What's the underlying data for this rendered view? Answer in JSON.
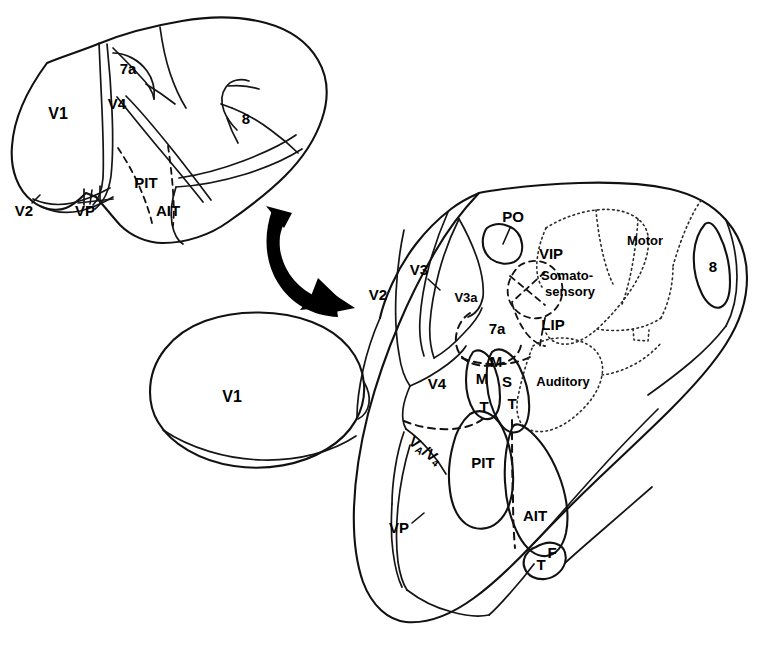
{
  "figure": {
    "background_color": "#ffffff",
    "ink_color": "#000000"
  },
  "lateral_view": {
    "name": "lateral-brain-view",
    "labels": [
      {
        "id": "v1",
        "text": "V1",
        "x": 58,
        "y": 115
      },
      {
        "id": "v2",
        "text": "V2",
        "x": 24,
        "y": 212
      },
      {
        "id": "vp",
        "text": "VP",
        "x": 85,
        "y": 212
      },
      {
        "id": "v4",
        "text": "V4",
        "x": 117,
        "y": 105
      },
      {
        "id": "7a",
        "text": "7a",
        "x": 128,
        "y": 70
      },
      {
        "id": "pit",
        "text": "PIT",
        "x": 146,
        "y": 184
      },
      {
        "id": "ait",
        "text": "AIT",
        "x": 168,
        "y": 212
      },
      {
        "id": "8",
        "text": "8",
        "x": 246,
        "y": 120
      }
    ]
  },
  "v1_oval": {
    "name": "v1-flattened-oval",
    "label": "V1",
    "label_x": 232,
    "label_y": 398
  },
  "arrow": {
    "name": "transform-arrow",
    "description": "curved black arrow indicating unfolding/flattening"
  },
  "flat_map": {
    "name": "flattened-cortical-map",
    "labels": [
      {
        "id": "v2",
        "text": "V2",
        "x": 378,
        "y": 296
      },
      {
        "id": "v3",
        "text": "V3",
        "x": 419,
        "y": 271
      },
      {
        "id": "v3a",
        "text": "V3a",
        "x": 466,
        "y": 299
      },
      {
        "id": "po",
        "text": "PO",
        "x": 513,
        "y": 218
      },
      {
        "id": "vip",
        "text": "VIP",
        "x": 551,
        "y": 255
      },
      {
        "id": "somatosensory_line1",
        "text": "Somato-",
        "x": 567,
        "y": 276
      },
      {
        "id": "somatosensory_line2",
        "text": "sensory",
        "x": 570,
        "y": 292
      },
      {
        "id": "lip",
        "text": "LIP",
        "x": 553,
        "y": 326
      },
      {
        "id": "7a",
        "text": "7a",
        "x": 497,
        "y": 330
      },
      {
        "id": "motor",
        "text": "Motor",
        "x": 645,
        "y": 242
      },
      {
        "id": "8",
        "text": "8",
        "x": 713,
        "y": 268
      },
      {
        "id": "auditory",
        "text": "Auditory",
        "x": 563,
        "y": 383
      },
      {
        "id": "v4",
        "text": "V4",
        "x": 437,
        "y": 385
      },
      {
        "id": "mt_m",
        "text": "M",
        "x": 483,
        "y": 379
      },
      {
        "id": "mt_t",
        "text": "T",
        "x": 484,
        "y": 408
      },
      {
        "id": "mst_m",
        "text": "M",
        "x": 494,
        "y": 366
      },
      {
        "id": "mst_s",
        "text": "S",
        "x": 504,
        "y": 382
      },
      {
        "id": "mst_t",
        "text": "T",
        "x": 510,
        "y": 404
      },
      {
        "id": "va_v4",
        "text": "VA/V4",
        "x": 424,
        "y": 450
      },
      {
        "id": "pit",
        "text": "PIT",
        "x": 487,
        "y": 463
      },
      {
        "id": "ait",
        "text": "AIT",
        "x": 534,
        "y": 516
      },
      {
        "id": "tf_t",
        "text": "T",
        "x": 541,
        "y": 563
      },
      {
        "id": "tf_f",
        "text": "F",
        "x": 551,
        "y": 553
      },
      {
        "id": "vp",
        "text": "VP",
        "x": 399,
        "y": 528
      }
    ]
  }
}
